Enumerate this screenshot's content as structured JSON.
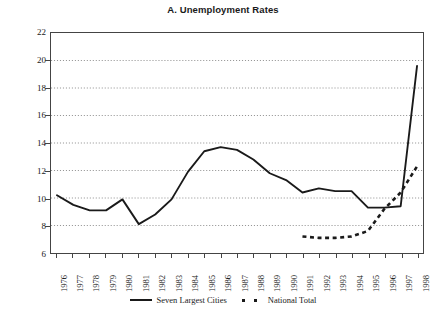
{
  "chart_data": {
    "type": "line",
    "title": "A. Unemployment Rates",
    "xlabel": "",
    "ylabel": "% of economically active population",
    "ylim": [
      6,
      22
    ],
    "ytick_step": 2,
    "yticks": [
      6,
      8,
      10,
      12,
      14,
      16,
      18,
      20,
      22
    ],
    "grid": true,
    "grid_style": "dotted-horizontal",
    "legend_position": "bottom-center",
    "categories": [
      "1976",
      "1977",
      "1978",
      "1979",
      "1980",
      "1981",
      "1982",
      "1983",
      "1984",
      "1985",
      "1986",
      "1987",
      "1988",
      "1989",
      "1990",
      "1991",
      "1992",
      "1993",
      "1994",
      "1995",
      "1996",
      "1997",
      "1998"
    ],
    "x": [
      1976,
      1977,
      1978,
      1979,
      1980,
      1981,
      1982,
      1983,
      1984,
      1985,
      1986,
      1987,
      1988,
      1989,
      1990,
      1991,
      1992,
      1993,
      1994,
      1995,
      1996,
      1997,
      1998
    ],
    "series": [
      {
        "name": "Seven Largest Cities",
        "style": "solid",
        "color": "#1a1a1a",
        "values": [
          10.2,
          9.5,
          9.1,
          9.1,
          9.9,
          8.1,
          8.8,
          9.9,
          11.9,
          13.4,
          13.7,
          13.5,
          12.8,
          11.8,
          11.3,
          10.4,
          10.7,
          10.5,
          10.5,
          9.3,
          9.3,
          9.4,
          10.4
        ],
        "last_value": 19.6,
        "endpoint_note": "rises steeply after 1996 to 19.6 at 1998"
      },
      {
        "name": "National Total",
        "style": "dashed",
        "color": "#1a1a1a",
        "start_year": 1991,
        "values": [
          null,
          null,
          null,
          null,
          null,
          null,
          null,
          null,
          null,
          null,
          null,
          null,
          null,
          null,
          null,
          7.2,
          7.1,
          7.1,
          7.2,
          7.6,
          9.2,
          10.4,
          12.3
        ]
      }
    ]
  },
  "legend": {
    "entries": [
      {
        "label": "Seven Largest Cities",
        "style": "solid"
      },
      {
        "label": "National Total",
        "style": "dashed"
      }
    ]
  }
}
